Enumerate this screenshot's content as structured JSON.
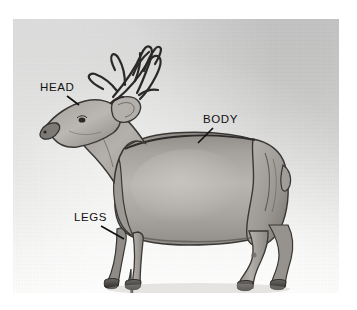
{
  "figure": {
    "medium": "pencil drawing",
    "background_top_color": "#c9c9c9",
    "background_bottom_color": "#fbfbfa",
    "page_color": "#ffffff",
    "ink_color": "#111111"
  },
  "annotations": [
    {
      "id": "head",
      "label": "HEAD",
      "x": 40,
      "y": 82,
      "leader": {
        "x1": 67,
        "y1": 96,
        "x2": 79,
        "y2": 105
      }
    },
    {
      "id": "body",
      "label": "BODY",
      "x": 203,
      "y": 114,
      "leader": {
        "x1": 213,
        "y1": 128,
        "x2": 198,
        "y2": 143
      }
    },
    {
      "id": "legs",
      "label": "LEGS",
      "x": 74,
      "y": 212,
      "leader": {
        "x1": 101,
        "y1": 226,
        "x2": 124,
        "y2": 239
      }
    }
  ],
  "deer": {
    "pose": "standing profile, facing left",
    "parts": [
      "antlers",
      "head",
      "ear",
      "eye",
      "muzzle",
      "neck",
      "body",
      "tail",
      "front legs",
      "hind legs",
      "hooves"
    ],
    "antler_tines": 8
  }
}
